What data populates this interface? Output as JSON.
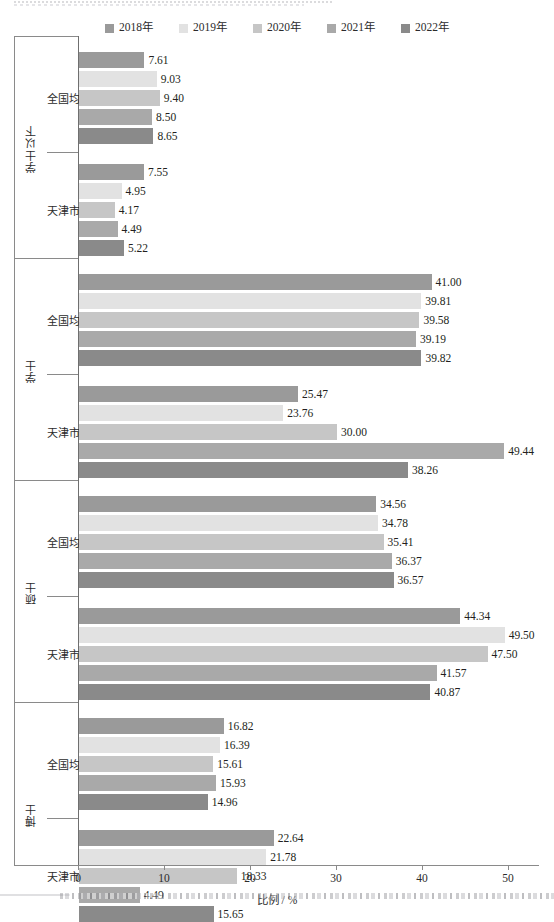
{
  "chart_data": {
    "type": "bar",
    "orientation": "horizontal",
    "title": "",
    "xlabel": "比例 / %",
    "ylabel": "",
    "xlim": [
      0,
      51.5
    ],
    "xticks": [
      0,
      10,
      20,
      30,
      40,
      50
    ],
    "grid": false,
    "legend_position": "top-center",
    "legend": [
      "2018年",
      "2019年",
      "2020年",
      "2021年",
      "2022年"
    ],
    "series_colors": [
      "#9a9a9a",
      "#e2e2e2",
      "#c6c6c6",
      "#a9a9a9",
      "#8a8a8a"
    ],
    "series": [
      {
        "name": "2018年",
        "values": [
          7.61,
          7.55,
          41.0,
          25.47,
          34.56,
          44.34,
          16.82,
          22.64
        ]
      },
      {
        "name": "2019年",
        "values": [
          9.03,
          4.95,
          39.81,
          23.76,
          34.78,
          49.5,
          16.39,
          21.78
        ]
      },
      {
        "name": "2020年",
        "values": [
          9.4,
          4.17,
          39.58,
          30.0,
          35.41,
          47.5,
          15.61,
          18.33
        ]
      },
      {
        "name": "2021年",
        "values": [
          8.5,
          4.49,
          39.19,
          49.44,
          36.37,
          41.57,
          15.93,
          4.49
        ]
      },
      {
        "name": "2022年",
        "values": [
          8.65,
          5.22,
          39.82,
          38.26,
          36.57,
          40.87,
          14.96,
          15.65
        ]
      }
    ],
    "groups": [
      {
        "label": "学士以下",
        "subgroups": [
          {
            "label": "全国均值",
            "bars": [
              {
                "series": "2018年",
                "value": 7.61,
                "label": "7.61",
                "length": 7.61
              },
              {
                "series": "2019年",
                "value": 9.03,
                "label": "9.03",
                "length": 9.03
              },
              {
                "series": "2020年",
                "value": 9.4,
                "label": "9.40",
                "length": 9.4
              },
              {
                "series": "2021年",
                "value": 8.5,
                "label": "8.50",
                "length": 8.5
              },
              {
                "series": "2022年",
                "value": 8.65,
                "label": "8.65",
                "length": 8.65
              }
            ]
          },
          {
            "label": "天津市",
            "bars": [
              {
                "series": "2018年",
                "value": 7.55,
                "label": "7.55",
                "length": 7.55
              },
              {
                "series": "2019年",
                "value": 4.95,
                "label": "4.95",
                "length": 4.95
              },
              {
                "series": "2020年",
                "value": 4.17,
                "label": "4.17",
                "length": 4.17
              },
              {
                "series": "2021年",
                "value": 4.49,
                "label": "4.49",
                "length": 4.49
              },
              {
                "series": "2022年",
                "value": 5.22,
                "label": "5.22",
                "length": 5.22
              }
            ]
          }
        ]
      },
      {
        "label": "学士",
        "subgroups": [
          {
            "label": "全国均值",
            "bars": [
              {
                "series": "2018年",
                "value": 41.0,
                "label": "41.00",
                "length": 41.0
              },
              {
                "series": "2019年",
                "value": 39.81,
                "label": "39.81",
                "length": 39.81
              },
              {
                "series": "2020年",
                "value": 39.58,
                "label": "39.58",
                "length": 39.58
              },
              {
                "series": "2021年",
                "value": 39.19,
                "label": "39.19",
                "length": 39.19
              },
              {
                "series": "2022年",
                "value": 39.82,
                "label": "39.82",
                "length": 39.82
              }
            ]
          },
          {
            "label": "天津市",
            "bars": [
              {
                "series": "2018年",
                "value": 25.47,
                "label": "25.47",
                "length": 25.47
              },
              {
                "series": "2019年",
                "value": 23.76,
                "label": "23.76",
                "length": 23.76
              },
              {
                "series": "2020年",
                "value": 30.0,
                "label": "30.00",
                "length": 30.0
              },
              {
                "series": "2021年",
                "value": 49.44,
                "label": "49.44",
                "length": 49.44
              },
              {
                "series": "2022年",
                "value": 38.26,
                "label": "38.26",
                "length": 38.26
              }
            ]
          }
        ]
      },
      {
        "label": "硕士",
        "subgroups": [
          {
            "label": "全国均值",
            "bars": [
              {
                "series": "2018年",
                "value": 34.56,
                "label": "34.56",
                "length": 34.56
              },
              {
                "series": "2019年",
                "value": 34.78,
                "label": "34.78",
                "length": 34.78
              },
              {
                "series": "2020年",
                "value": 35.41,
                "label": "35.41",
                "length": 35.41
              },
              {
                "series": "2021年",
                "value": 36.37,
                "label": "36.37",
                "length": 36.37
              },
              {
                "series": "2022年",
                "value": 36.57,
                "label": "36.57",
                "length": 36.57
              }
            ]
          },
          {
            "label": "天津市",
            "bars": [
              {
                "series": "2018年",
                "value": 44.34,
                "label": "44.34",
                "length": 44.34
              },
              {
                "series": "2019年",
                "value": 49.5,
                "label": "49.50",
                "length": 49.5
              },
              {
                "series": "2020年",
                "value": 47.5,
                "label": "47.50",
                "length": 47.5
              },
              {
                "series": "2021年",
                "value": 41.57,
                "label": "41.57",
                "length": 41.57
              },
              {
                "series": "2022年",
                "value": 40.87,
                "label": "40.87",
                "length": 40.87
              }
            ]
          }
        ]
      },
      {
        "label": "博士",
        "subgroups": [
          {
            "label": "全国均值",
            "bars": [
              {
                "series": "2018年",
                "value": 16.82,
                "label": "16.82",
                "length": 16.82
              },
              {
                "series": "2019年",
                "value": 16.39,
                "label": "16.39",
                "length": 16.39
              },
              {
                "series": "2020年",
                "value": 15.61,
                "label": "15.61",
                "length": 15.61
              },
              {
                "series": "2021年",
                "value": 15.93,
                "label": "15.93",
                "length": 15.93
              },
              {
                "series": "2022年",
                "value": 14.96,
                "label": "14.96",
                "length": 14.96
              }
            ]
          },
          {
            "label": "天津市",
            "bars": [
              {
                "series": "2018年",
                "value": 22.64,
                "label": "22.64",
                "length": 22.64
              },
              {
                "series": "2019年",
                "value": 21.78,
                "label": "21.78",
                "length": 21.78
              },
              {
                "series": "2020年",
                "value": 18.33,
                "label": "18.33",
                "length": 18.33
              },
              {
                "series": "2021年",
                "value": 4.49,
                "label": "4.49",
                "length": 7.05
              },
              {
                "series": "2022年",
                "value": 15.65,
                "label": "15.65",
                "length": 15.65
              }
            ]
          }
        ]
      }
    ]
  }
}
